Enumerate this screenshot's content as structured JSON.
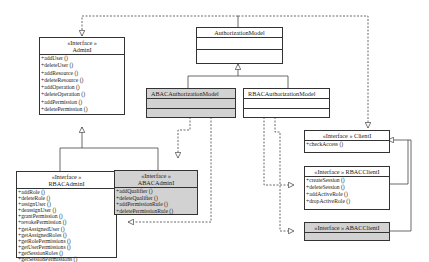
{
  "diagram": {
    "type": "UML class diagram",
    "classes": {
      "authorization_model": {
        "name": "AuthorizationModel"
      },
      "abac_authorization_model": {
        "name": "ABACAuthorizationModel"
      },
      "rbac_authorization_model": {
        "name": "RBACAuthorizationModel"
      },
      "admin_i": {
        "stereotype": "«Interface »",
        "name": "AdminI",
        "methods": [
          "+addUser ()",
          "+deleteUser ()",
          "+addResource ()",
          "+deleteResource ()",
          "+addOperation ()",
          "+deleteOperation ()",
          "+addPermission ()",
          "+deletePermission ()"
        ]
      },
      "rbac_admin_i": {
        "stereotype": "«Interface »",
        "name": "RBACAdminI",
        "methods": [
          "+addRole ()",
          "+deleteRole ()",
          "+assignUser ()",
          "+deassignUser ()",
          "+grantPermission ()",
          "+revokePermission ()",
          "+getAssignedUser ()",
          "+getAssignedRoles ()",
          "+getRolePermissions ()",
          "+getUserPermissions ()",
          "+getSessionRoles ()",
          "+getSessionPermissions ()"
        ]
      },
      "abac_admin_i": {
        "stereotype": "«Interface »",
        "name": "ABACAdminI",
        "methods": [
          "+addQualifier ()",
          "+deleteQualifier ()",
          "+addPermissionRule ()",
          "+deletePermissionRule ()"
        ]
      },
      "client_i": {
        "title": "«Interface » ClientI",
        "methods": [
          "+checkAccess ()"
        ]
      },
      "rbac_client_i": {
        "title": "«Interface » RBACClientI",
        "methods": [
          "+createSession ()",
          "+deleteSession ()",
          "+addActiveRole ()",
          "+dropActiveRole ()"
        ]
      },
      "abac_client_i": {
        "title": "«Interface » ABACClientI"
      }
    },
    "colors": {
      "line": "#333333",
      "highlight_fill": "#d2d2d2",
      "background": "#ffffff"
    }
  }
}
